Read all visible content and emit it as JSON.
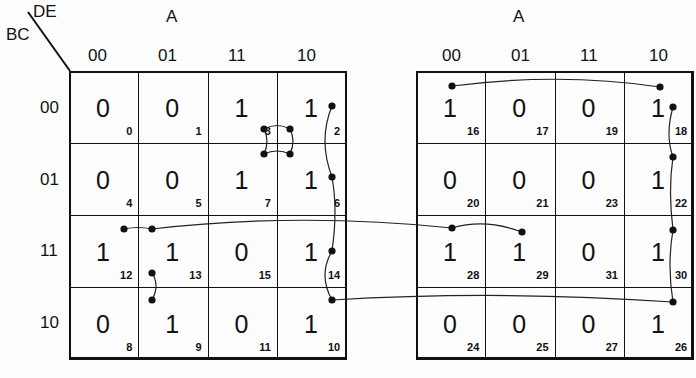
{
  "maps": [
    {
      "id": "left",
      "a_label": "A",
      "row_var": "BC",
      "col_var": "DE",
      "col_labels": [
        "00",
        "01",
        "11",
        "10"
      ],
      "row_labels": [
        "00",
        "01",
        "11",
        "10"
      ],
      "cells": [
        [
          {
            "v": "0",
            "i": "0"
          },
          {
            "v": "0",
            "i": "1"
          },
          {
            "v": "1",
            "i": "3"
          },
          {
            "v": "1",
            "i": "2"
          }
        ],
        [
          {
            "v": "0",
            "i": "4"
          },
          {
            "v": "0",
            "i": "5"
          },
          {
            "v": "1",
            "i": "7"
          },
          {
            "v": "1",
            "i": "6"
          }
        ],
        [
          {
            "v": "1",
            "i": "12"
          },
          {
            "v": "1",
            "i": "13"
          },
          {
            "v": "0",
            "i": "15"
          },
          {
            "v": "1",
            "i": "14"
          }
        ],
        [
          {
            "v": "0",
            "i": "8"
          },
          {
            "v": "1",
            "i": "9"
          },
          {
            "v": "0",
            "i": "11"
          },
          {
            "v": "1",
            "i": "10"
          }
        ]
      ]
    },
    {
      "id": "right",
      "a_label": "A",
      "col_labels": [
        "00",
        "01",
        "11",
        "10"
      ],
      "cells": [
        [
          {
            "v": "1",
            "i": "16"
          },
          {
            "v": "0",
            "i": "17"
          },
          {
            "v": "0",
            "i": "19"
          },
          {
            "v": "1",
            "i": "18"
          }
        ],
        [
          {
            "v": "0",
            "i": "20"
          },
          {
            "v": "0",
            "i": "21"
          },
          {
            "v": "0",
            "i": "23"
          },
          {
            "v": "1",
            "i": "22"
          }
        ],
        [
          {
            "v": "1",
            "i": "28"
          },
          {
            "v": "1",
            "i": "29"
          },
          {
            "v": "0",
            "i": "31"
          },
          {
            "v": "1",
            "i": "30"
          }
        ],
        [
          {
            "v": "0",
            "i": "24"
          },
          {
            "v": "0",
            "i": "25"
          },
          {
            "v": "0",
            "i": "27"
          },
          {
            "v": "1",
            "i": "26"
          }
        ]
      ]
    }
  ]
}
